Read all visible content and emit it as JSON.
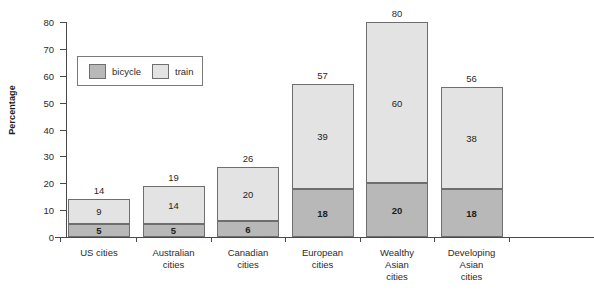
{
  "chart_data": {
    "type": "bar",
    "subtype": "stacked-vertical",
    "title": "",
    "xlabel": "",
    "ylabel": "Percentage",
    "ylim": [
      0,
      80
    ],
    "yticks": [
      0,
      10,
      20,
      30,
      40,
      50,
      60,
      70,
      80
    ],
    "grid": false,
    "legend_position": "upper-left-inset",
    "categories": [
      "US cities",
      "Australian cities",
      "Canadian cities",
      "European cities",
      "Wealthy Asian cities",
      "Developing Asian cities"
    ],
    "category_lines": [
      [
        "US cities"
      ],
      [
        "Australian",
        "cities"
      ],
      [
        "Canadian",
        "cities"
      ],
      [
        "European",
        "cities"
      ],
      [
        "Wealthy",
        "Asian",
        "cities"
      ],
      [
        "Developing",
        "Asian",
        "cities"
      ]
    ],
    "series": [
      {
        "name": "bicycle",
        "color": "#b8b8b8",
        "values": [
          5,
          5,
          6,
          18,
          20,
          18
        ]
      },
      {
        "name": "train",
        "color": "#e3e3e3",
        "values": [
          9,
          14,
          20,
          39,
          60,
          38
        ]
      }
    ],
    "totals": [
      14,
      19,
      26,
      57,
      80,
      56
    ]
  },
  "legend": {
    "items": [
      {
        "label": "bicycle",
        "swatch": "bicycle"
      },
      {
        "label": "train",
        "swatch": "train"
      }
    ]
  },
  "colors": {
    "bicycle": "#b8b8b8",
    "train": "#e3e3e3",
    "axis": "#4a4a4a",
    "outline": "#6e6e6e",
    "text": "#2b2b2b",
    "background": "#ffffff"
  }
}
